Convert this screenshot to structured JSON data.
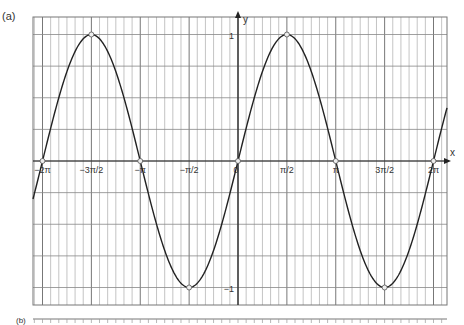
{
  "panel_label": "(a)",
  "next_panel_label": "(b)",
  "chart_data": {
    "type": "line",
    "title": "",
    "function": "y = sin x",
    "xlabel": "x",
    "ylabel": "y",
    "xlim": [
      -6.58,
      6.82
    ],
    "ylim": [
      -1.14,
      1.14
    ],
    "x_tick_labels": [
      "-2π",
      "-3π/2",
      "-π",
      "-π/2",
      "0",
      "π/2",
      "π",
      "3π/2",
      "2π"
    ],
    "x_tick_values": [
      -6.2832,
      -4.7124,
      -3.1416,
      -1.5708,
      0,
      1.5708,
      3.1416,
      4.7124,
      6.2832
    ],
    "y_tick_labels": [
      "1",
      "-1"
    ],
    "y_tick_values": [
      1,
      -1
    ],
    "marked_points": [
      {
        "x": -6.2832,
        "y": 0
      },
      {
        "x": -4.7124,
        "y": 1
      },
      {
        "x": -3.1416,
        "y": 0
      },
      {
        "x": -1.5708,
        "y": -1
      },
      {
        "x": 0,
        "y": 0
      },
      {
        "x": 1.5708,
        "y": 1
      },
      {
        "x": 3.1416,
        "y": 0
      },
      {
        "x": 4.7124,
        "y": -1
      },
      {
        "x": 6.2832,
        "y": 0
      }
    ],
    "grid": true
  }
}
